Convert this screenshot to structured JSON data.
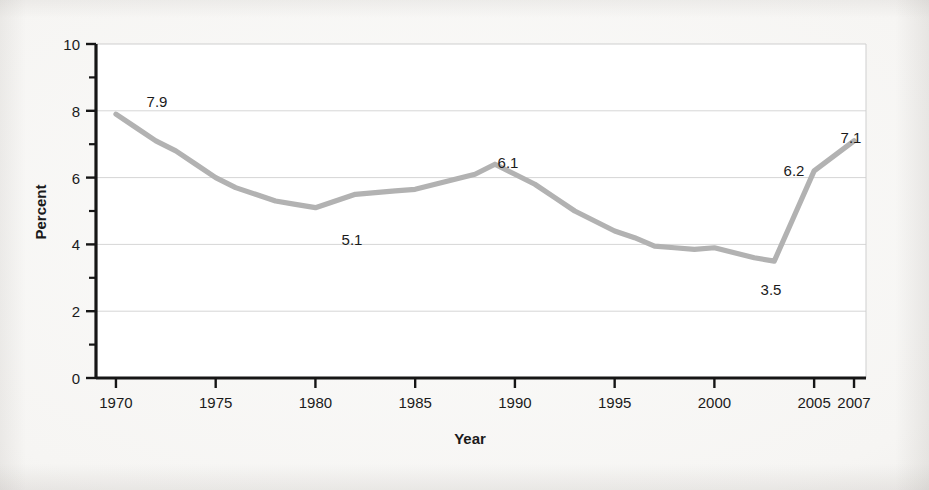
{
  "figure": {
    "background_color": "#f5f4f2",
    "plot_background_color": "#ffffff"
  },
  "chart_data": {
    "type": "line",
    "title": "",
    "subtitle": "",
    "xlabel": "Year",
    "ylabel": "Percent",
    "xlim": [
      1969,
      2007.6
    ],
    "ylim": [
      0,
      10
    ],
    "grid": "horizontal-major",
    "legend": "none",
    "line_color": "#b2b2b2",
    "x_tick_labels": [
      "1970",
      "1975",
      "1980",
      "1985",
      "1990",
      "1995",
      "2000",
      "2005",
      "2007"
    ],
    "x_ticks": [
      1970,
      1975,
      1980,
      1985,
      1990,
      1995,
      2000,
      2005,
      2007
    ],
    "y_tick_labels": [
      "0",
      "2",
      "4",
      "6",
      "8",
      "10"
    ],
    "y_ticks": [
      0,
      2,
      4,
      6,
      8,
      10
    ],
    "y_minor_ticks": [
      1,
      3,
      5,
      7,
      9
    ],
    "x": [
      1970,
      1971,
      1972,
      1973,
      1974,
      1975,
      1976,
      1977,
      1978,
      1979,
      1980,
      1981,
      1982,
      1983,
      1984,
      1985,
      1986,
      1987,
      1988,
      1989,
      1990,
      1991,
      1992,
      1993,
      1994,
      1995,
      1996,
      1997,
      1998,
      1999,
      2000,
      2001,
      2002,
      2003,
      2004,
      2005,
      2006,
      2007
    ],
    "values": [
      7.9,
      7.5,
      7.1,
      6.8,
      6.4,
      6.0,
      5.7,
      5.5,
      5.3,
      5.2,
      5.1,
      5.3,
      5.5,
      5.55,
      5.6,
      5.65,
      5.8,
      5.95,
      6.1,
      6.4,
      6.1,
      5.8,
      5.4,
      5.0,
      4.7,
      4.4,
      4.2,
      3.95,
      3.9,
      3.85,
      3.9,
      3.75,
      3.6,
      3.5,
      4.85,
      6.2,
      6.65,
      7.1
    ],
    "annotations": [
      {
        "label": "7.9",
        "x": 1970,
        "y": 7.9,
        "px": 157,
        "py": 107
      },
      {
        "label": "5.1",
        "x": 1980,
        "y": 5.1,
        "px": 352,
        "py": 245
      },
      {
        "label": "6.1",
        "x": 1988,
        "y": 6.1,
        "px": 508,
        "py": 168
      },
      {
        "label": "3.5",
        "x": 2003,
        "y": 3.5,
        "px": 771,
        "py": 295
      },
      {
        "label": "6.2",
        "x": 2005,
        "y": 6.2,
        "px": 794,
        "py": 176
      },
      {
        "label": "7.1",
        "x": 2007,
        "y": 7.1,
        "px": 851,
        "py": 143
      }
    ]
  }
}
